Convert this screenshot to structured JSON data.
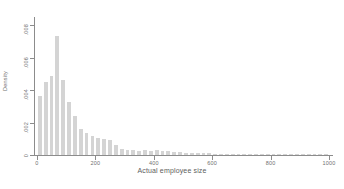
{
  "chart_data": {
    "type": "bar",
    "title": "",
    "subtitle": "",
    "xlabel": "Actual employee size",
    "ylabel": "Density",
    "xlim": [
      -10,
      1010
    ],
    "ylim": [
      0,
      0.0085
    ],
    "grid": false,
    "legend": null,
    "x_ticks": [
      "0",
      "200",
      "400",
      "600",
      "800",
      "1000"
    ],
    "x_tick_values": [
      0,
      200,
      400,
      600,
      800,
      1000
    ],
    "y_ticks": [
      "0",
      ".002",
      ".004",
      ".006",
      ".008"
    ],
    "y_tick_values": [
      0,
      0.002,
      0.004,
      0.006,
      0.008
    ],
    "bin_width": 20,
    "bar_color": "#d4d4d4",
    "axis_color": "#8c8c8c",
    "text_color": "#6f6f6f",
    "categories": [
      10,
      30,
      50,
      70,
      90,
      110,
      130,
      150,
      170,
      190,
      210,
      230,
      250,
      270,
      290,
      310,
      330,
      350,
      370,
      390,
      410,
      430,
      450,
      470,
      490,
      510,
      530,
      550,
      570,
      590,
      610,
      630,
      650,
      670,
      690,
      710,
      730,
      750,
      770,
      790,
      810,
      830,
      850,
      870,
      890,
      910,
      930,
      950,
      970,
      990
    ],
    "values": [
      0.00365,
      0.0045,
      0.00487,
      0.00735,
      0.00462,
      0.00325,
      0.0024,
      0.0016,
      0.00133,
      0.0012,
      0.00105,
      0.00098,
      0.00095,
      0.00062,
      0.0004,
      0.00033,
      0.0003,
      0.00027,
      0.00028,
      0.00026,
      0.0003,
      0.00026,
      0.00022,
      0.00019,
      0.00017,
      0.00014,
      0.00012,
      0.00013,
      0.00012,
      0.0001,
      9e-05,
      9e-05,
      8e-05,
      9e-05,
      7e-05,
      7e-05,
      8e-05,
      7e-05,
      5e-05,
      5e-05,
      4e-05,
      6e-05,
      4e-05,
      3e-05,
      3e-05,
      2e-05,
      2e-05,
      2e-05,
      2e-05,
      1e-05
    ]
  },
  "caption": {
    "text": ""
  }
}
